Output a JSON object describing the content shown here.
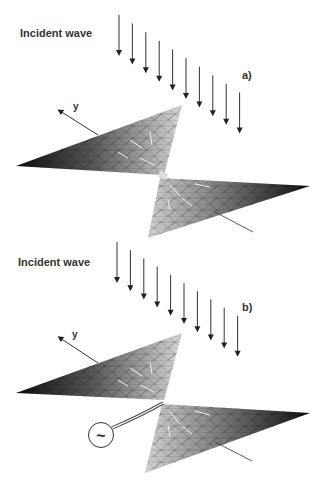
{
  "panels": [
    {
      "id": "a",
      "incident_label": "Incident wave",
      "panel_label": "a)",
      "axis_label": "y",
      "has_source": false
    },
    {
      "id": "b",
      "incident_label": "Incident wave",
      "panel_label": "b)",
      "axis_label": "y",
      "has_source": true,
      "source_symbol": "~"
    }
  ],
  "arrow_count": 10,
  "colors": {
    "ink": "#222222",
    "mesh_dark": "#111111",
    "mesh_light": "#e8e8e8",
    "background": "#ffffff"
  }
}
